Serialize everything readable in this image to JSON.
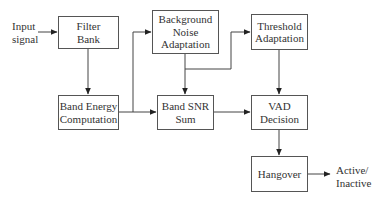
{
  "diagram": {
    "type": "block-diagram",
    "inputs": {
      "input_signal": [
        "Input",
        "signal"
      ]
    },
    "outputs": {
      "active_inactive": [
        "Active/",
        "Inactive"
      ]
    },
    "blocks": {
      "filter_bank": [
        "Filter",
        "Bank"
      ],
      "background_noise": [
        "Background",
        "Noise",
        "Adaptation"
      ],
      "threshold": [
        "Threshold",
        "Adaptation"
      ],
      "band_energy": [
        "Band Energy",
        "Computation"
      ],
      "band_snr": [
        "Band SNR",
        "Sum"
      ],
      "vad_decision": [
        "VAD",
        "Decision"
      ],
      "hangover": [
        "Hangover"
      ]
    },
    "edges": [
      [
        "Input signal",
        "Filter Bank"
      ],
      [
        "Filter Bank",
        "Band Energy Computation"
      ],
      [
        "Band Energy Computation",
        "Band SNR Sum"
      ],
      [
        "Band Energy Computation",
        "Background Noise Adaptation"
      ],
      [
        "Background Noise Adaptation",
        "Band SNR Sum"
      ],
      [
        "Background Noise Adaptation",
        "Threshold Adaptation"
      ],
      [
        "Band SNR Sum",
        "VAD Decision"
      ],
      [
        "Threshold Adaptation",
        "VAD Decision"
      ],
      [
        "VAD Decision",
        "Hangover"
      ],
      [
        "Hangover",
        "Active/Inactive"
      ]
    ]
  }
}
